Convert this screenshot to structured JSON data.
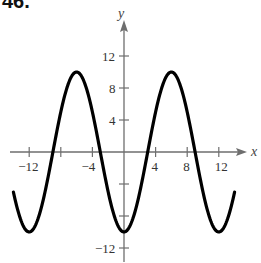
{
  "problem_number": "46.",
  "chart_data": {
    "type": "line",
    "title": "",
    "xlabel": "x",
    "ylabel": "y",
    "function": "y = -10 cos(πx/6)",
    "xlim": [
      -15,
      15
    ],
    "ylim": [
      -13,
      15
    ],
    "x_ticks": [
      -12,
      -8,
      -4,
      4,
      8,
      12
    ],
    "x_tick_labels": [
      "-12",
      "-4",
      "4",
      "8",
      "12"
    ],
    "y_ticks": [
      12,
      8,
      4,
      -4,
      -8,
      -12
    ],
    "y_tick_labels": [
      "12",
      "8",
      "4",
      "-12"
    ],
    "grid": false,
    "legend": null,
    "series": [
      {
        "name": "curve",
        "x": [
          -14,
          -12,
          -9,
          -6,
          -3,
          0,
          3,
          6,
          9,
          12,
          14
        ],
        "y": [
          -5,
          -10,
          0,
          10,
          0,
          -10,
          0,
          10,
          0,
          -10,
          -5
        ]
      }
    ],
    "key_points": {
      "maxima": [
        [
          -6,
          10
        ],
        [
          6,
          10
        ]
      ],
      "minima": [
        [
          -12,
          -10
        ],
        [
          0,
          -10
        ],
        [
          12,
          -10
        ]
      ],
      "zeros": [
        -9,
        -3,
        3,
        9
      ]
    }
  },
  "colors": {
    "curve": "#000000",
    "axes": "#6e6e6e",
    "text": "#333333"
  }
}
